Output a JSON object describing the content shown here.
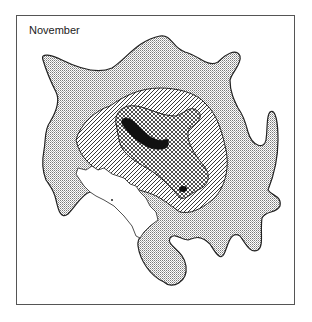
{
  "map": {
    "title": "November",
    "layers": [
      {
        "name": "outer-extent",
        "fill": "fine-dot-stipple"
      },
      {
        "name": "middle-zone",
        "fill": "diagonal-hatch"
      },
      {
        "name": "inner-zone",
        "fill": "cross-hatch"
      },
      {
        "name": "core",
        "fill": "solid-black"
      },
      {
        "name": "land",
        "fill": "white"
      }
    ],
    "colors": {
      "outline": "#222222",
      "stipple": "#888888",
      "background": "#ffffff"
    }
  }
}
